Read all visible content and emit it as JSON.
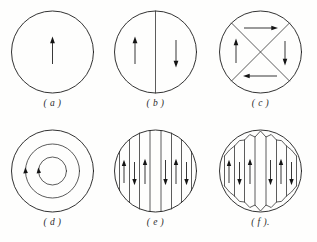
{
  "figure": {
    "background_color": "#fefefd",
    "line_color": "#1c1c1c",
    "panel_count": 6,
    "rows": 2,
    "columns": 3
  },
  "panels": [
    {
      "id": "a",
      "caption": "( a )",
      "description": "single domain, uniform magnetization upward",
      "domain_count": 1,
      "wall_type": "none",
      "walls": 0,
      "arrows": [
        {
          "name": "arrow-up-center",
          "direction": "up",
          "x": 52.5,
          "y": 50
        }
      ]
    },
    {
      "id": "b",
      "caption": "( b )",
      "description": "two domains separated by one vertical 180 degree wall",
      "domain_count": 2,
      "wall_type": "vertical-diameter",
      "walls": 1,
      "arrows": [
        {
          "name": "arrow-up-left",
          "direction": "up",
          "x": 32,
          "y": 50
        },
        {
          "name": "arrow-down-right",
          "direction": "down",
          "x": 73,
          "y": 50
        }
      ]
    },
    {
      "id": "c",
      "caption": "( c )",
      "description": "four closure domains formed by two diagonal walls, flux circulates",
      "domain_count": 4,
      "wall_type": "diagonal-cross",
      "walls": 2,
      "arrows": [
        {
          "name": "arrow-up-left",
          "direction": "up",
          "x": 28,
          "y": 50
        },
        {
          "name": "arrow-right-top",
          "direction": "right",
          "x": 52.5,
          "y": 26
        },
        {
          "name": "arrow-down-right",
          "direction": "down",
          "x": 77,
          "y": 50
        },
        {
          "name": "arrow-left-bottom",
          "direction": "left",
          "x": 52.5,
          "y": 74
        }
      ]
    },
    {
      "id": "d",
      "caption": "( d )",
      "description": "concentric circular flux closure, three rings",
      "domain_count": 3,
      "wall_type": "concentric-rings",
      "walls": 2,
      "ring_radii": [
        41,
        27,
        14
      ],
      "arrows": [
        {
          "name": "arrowhead-middle-ring",
          "direction": "counterclockwise",
          "x": 25.5,
          "y": 50
        },
        {
          "name": "arrowhead-inner-ring",
          "direction": "counterclockwise",
          "x": 38.5,
          "y": 50
        }
      ]
    },
    {
      "id": "e",
      "caption": "( e )",
      "description": "lamellar stripe domains with alternating magnetization, no closure",
      "domain_count": 8,
      "wall_type": "vertical-stripes",
      "walls": 7,
      "stripe_offsets": [
        -36,
        -26,
        -16,
        -5.5,
        5.5,
        16,
        26,
        36
      ],
      "arrows": [
        {
          "name": "stripe-arrow-1",
          "direction": "up",
          "x": 21
        },
        {
          "name": "stripe-arrow-2",
          "direction": "down",
          "x": 31.5
        },
        {
          "name": "stripe-arrow-3",
          "direction": "up",
          "x": 42
        },
        {
          "name": "stripe-arrow-4",
          "direction": "down",
          "x": 58
        },
        {
          "name": "stripe-arrow-5",
          "direction": "up",
          "x": 70
        },
        {
          "name": "stripe-arrow-6",
          "direction": "down",
          "x": 81
        }
      ]
    },
    {
      "id": "f",
      "caption": "( f ).",
      "description": "lamellar stripe domains terminated by triangular closure domains at top and bottom",
      "domain_count": 8,
      "wall_type": "vertical-stripes-with-closure",
      "walls": 7,
      "closure": "triangular-zigzag-top-and-bottom",
      "arrows": [
        {
          "name": "stripe-arrow-1",
          "direction": "up",
          "x": 21
        },
        {
          "name": "stripe-arrow-2",
          "direction": "down",
          "x": 31.5
        },
        {
          "name": "stripe-arrow-3",
          "direction": "up",
          "x": 42
        },
        {
          "name": "stripe-arrow-4",
          "direction": "down",
          "x": 58
        },
        {
          "name": "stripe-arrow-5",
          "direction": "up",
          "x": 70
        },
        {
          "name": "stripe-arrow-6",
          "direction": "down",
          "x": 81
        }
      ]
    }
  ]
}
